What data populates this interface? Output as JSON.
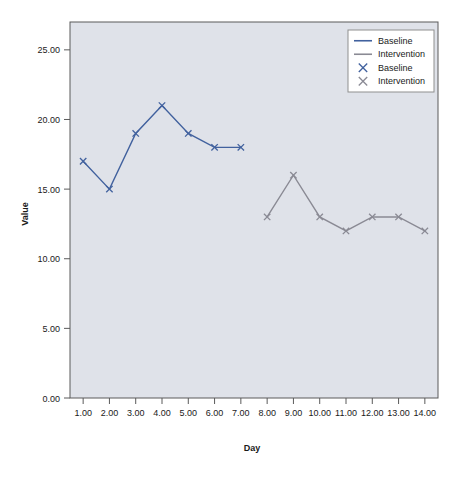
{
  "chart_data": {
    "type": "line",
    "title": "",
    "xlabel": "Day",
    "ylabel": "Value",
    "xlim": [
      0.5,
      14.5
    ],
    "ylim": [
      0.0,
      27.0
    ],
    "grid": false,
    "legend_position": "top-right",
    "x_tick_labels": [
      "1.00",
      "2.00",
      "3.00",
      "4.00",
      "5.00",
      "6.00",
      "7.00",
      "8.00",
      "9.00",
      "10.00",
      "11.00",
      "12.00",
      "13.00",
      "14.00"
    ],
    "x_tick_values": [
      1,
      2,
      3,
      4,
      5,
      6,
      7,
      8,
      9,
      10,
      11,
      12,
      13,
      14
    ],
    "y_tick_labels": [
      "0.00",
      "5.00",
      "10.00",
      "15.00",
      "20.00",
      "25.00"
    ],
    "y_tick_values": [
      0,
      5,
      10,
      15,
      20,
      25
    ],
    "series": [
      {
        "name": "Baseline",
        "color": "#41619e",
        "marker": "x",
        "x": [
          1,
          2,
          3,
          4,
          5,
          6,
          7
        ],
        "values": [
          17,
          15,
          19,
          21,
          19,
          18,
          18
        ]
      },
      {
        "name": "Intervention",
        "color": "#8a8a94",
        "marker": "x",
        "x": [
          8,
          9,
          10,
          11,
          12,
          13,
          14
        ],
        "values": [
          13,
          16,
          13,
          12,
          13,
          13,
          12
        ]
      }
    ],
    "legend_entries": [
      {
        "label": "Baseline",
        "kind": "line",
        "color": "#41619e"
      },
      {
        "label": "Intervention",
        "kind": "line",
        "color": "#8a8a94"
      },
      {
        "label": "Baseline",
        "kind": "marker",
        "color": "#41619e"
      },
      {
        "label": "Intervention",
        "kind": "marker",
        "color": "#8a8a94"
      }
    ],
    "plot_background": "#dfe2e9",
    "page_background": "#ffffff",
    "frame_color": "#5a5a5a"
  }
}
